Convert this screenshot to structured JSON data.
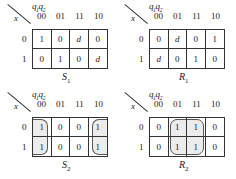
{
  "maps": [
    {
      "name": "S",
      "sub": "1",
      "row_var": "x",
      "col_var_1": "q",
      "col_sub_1": "1",
      "col_var_2": "q",
      "col_sub_2": "2",
      "columns": [
        "00",
        "01",
        "11",
        "10"
      ],
      "rows": [
        "0",
        "1"
      ],
      "cells": [
        [
          "1",
          "0",
          "d",
          "0"
        ],
        [
          "0",
          "1",
          "0",
          "d"
        ]
      ]
    },
    {
      "name": "R",
      "sub": "1",
      "row_var": "x",
      "col_var_1": "q",
      "col_sub_1": "1",
      "col_var_2": "q",
      "col_sub_2": "2",
      "columns": [
        "00",
        "01",
        "11",
        "10"
      ],
      "rows": [
        "0",
        "1"
      ],
      "cells": [
        [
          "0",
          "d",
          "0",
          "1"
        ],
        [
          "d",
          "0",
          "1",
          "0"
        ]
      ]
    },
    {
      "name": "S",
      "sub": "2",
      "row_var": "x",
      "col_var_1": "q",
      "col_sub_1": "1",
      "col_var_2": "q",
      "col_sub_2": "2",
      "columns": [
        "00",
        "01",
        "11",
        "10"
      ],
      "rows": [
        "0",
        "1"
      ],
      "cells": [
        [
          "1",
          "0",
          "0",
          "1"
        ],
        [
          "1",
          "0",
          "0",
          "1"
        ]
      ],
      "groups": [
        "column 00 rows 0-1 (wrap with column 10)",
        "column 10 rows 0-1"
      ]
    },
    {
      "name": "R",
      "sub": "2",
      "row_var": "x",
      "col_var_1": "q",
      "col_sub_1": "1",
      "col_var_2": "q",
      "col_sub_2": "2",
      "columns": [
        "00",
        "01",
        "11",
        "10"
      ],
      "rows": [
        "0",
        "1"
      ],
      "cells": [
        [
          "0",
          "1",
          "1",
          "0"
        ],
        [
          "0",
          "1",
          "1",
          "0"
        ]
      ],
      "groups": [
        "columns 01-11 rows 0-1"
      ]
    }
  ]
}
